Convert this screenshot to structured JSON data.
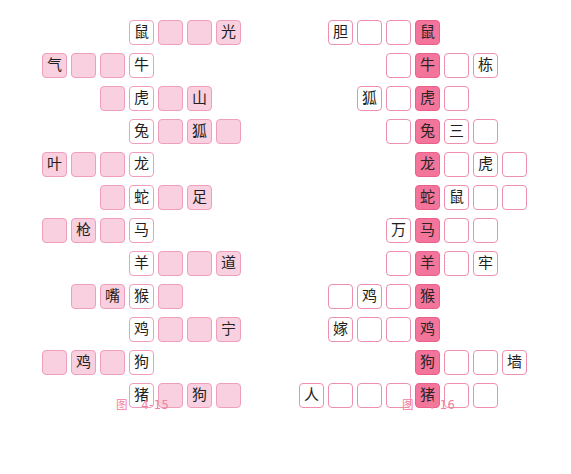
{
  "page": {
    "background": "#ffffff",
    "top_cut_text_left": "",
    "top_cut_text_right": ""
  },
  "colors": {
    "light_pink_fill": "#f9d0e0",
    "light_pink_border": "#ef9ebb",
    "dark_pink_fill": "#f4759b",
    "dark_pink_border": "#ec5f8b",
    "white_cell": "#ffffff",
    "caption_pink": "#f2809f",
    "text_dark": "#231f20"
  },
  "figures": [
    {
      "id": "figure-4-15",
      "caption_word": "图",
      "caption_number": "4-15",
      "cell_size": 25,
      "cell_gap": 4,
      "col_origin_x": 13,
      "row_origin_y": 8,
      "row_pitch": 33,
      "col_pitch": 29,
      "animal_col": 4,
      "style": {
        "blank": "pinkfill",
        "clue": "pinkfill",
        "animal": "whitecell"
      },
      "rows": [
        {
          "row": 0,
          "start_col": 4,
          "cells": [
            {
              "text": "鼠",
              "kind": "animal"
            },
            {
              "text": "",
              "kind": "blank"
            },
            {
              "text": "",
              "kind": "blank"
            },
            {
              "text": "光",
              "kind": "clue"
            }
          ]
        },
        {
          "row": 1,
          "start_col": 1,
          "cells": [
            {
              "text": "气",
              "kind": "clue"
            },
            {
              "text": "",
              "kind": "blank"
            },
            {
              "text": "",
              "kind": "blank"
            },
            {
              "text": "牛",
              "kind": "animal"
            }
          ]
        },
        {
          "row": 2,
          "start_col": 3,
          "cells": [
            {
              "text": "",
              "kind": "blank"
            },
            {
              "text": "虎",
              "kind": "animal"
            },
            {
              "text": "",
              "kind": "blank"
            },
            {
              "text": "山",
              "kind": "clue"
            }
          ]
        },
        {
          "row": 3,
          "start_col": 4,
          "cells": [
            {
              "text": "兔",
              "kind": "animal"
            },
            {
              "text": "",
              "kind": "blank"
            },
            {
              "text": "狐",
              "kind": "clue"
            },
            {
              "text": "",
              "kind": "blank"
            }
          ]
        },
        {
          "row": 4,
          "start_col": 1,
          "cells": [
            {
              "text": "叶",
              "kind": "clue"
            },
            {
              "text": "",
              "kind": "blank"
            },
            {
              "text": "",
              "kind": "blank"
            },
            {
              "text": "龙",
              "kind": "animal"
            }
          ]
        },
        {
          "row": 5,
          "start_col": 3,
          "cells": [
            {
              "text": "",
              "kind": "blank"
            },
            {
              "text": "蛇",
              "kind": "animal"
            },
            {
              "text": "",
              "kind": "blank"
            },
            {
              "text": "足",
              "kind": "clue"
            }
          ]
        },
        {
          "row": 6,
          "start_col": 1,
          "cells": [
            {
              "text": "",
              "kind": "blank"
            },
            {
              "text": "枪",
              "kind": "clue"
            },
            {
              "text": "",
              "kind": "blank"
            },
            {
              "text": "马",
              "kind": "animal"
            }
          ]
        },
        {
          "row": 7,
          "start_col": 4,
          "cells": [
            {
              "text": "羊",
              "kind": "animal"
            },
            {
              "text": "",
              "kind": "blank"
            },
            {
              "text": "",
              "kind": "blank"
            },
            {
              "text": "道",
              "kind": "clue"
            }
          ]
        },
        {
          "row": 8,
          "start_col": 2,
          "cells": [
            {
              "text": "",
              "kind": "blank"
            },
            {
              "text": "嘴",
              "kind": "clue"
            },
            {
              "text": "猴",
              "kind": "animal"
            },
            {
              "text": "",
              "kind": "blank"
            }
          ]
        },
        {
          "row": 9,
          "start_col": 4,
          "cells": [
            {
              "text": "鸡",
              "kind": "animal"
            },
            {
              "text": "",
              "kind": "blank"
            },
            {
              "text": "",
              "kind": "blank"
            },
            {
              "text": "宁",
              "kind": "clue"
            }
          ]
        },
        {
          "row": 10,
          "start_col": 1,
          "cells": [
            {
              "text": "",
              "kind": "blank"
            },
            {
              "text": "鸡",
              "kind": "clue"
            },
            {
              "text": "",
              "kind": "blank"
            },
            {
              "text": "狗",
              "kind": "animal"
            }
          ]
        },
        {
          "row": 11,
          "start_col": 4,
          "cells": [
            {
              "text": "猪",
              "kind": "animal"
            },
            {
              "text": "",
              "kind": "blank"
            },
            {
              "text": "狗",
              "kind": "clue"
            },
            {
              "text": "",
              "kind": "blank"
            }
          ]
        }
      ]
    },
    {
      "id": "figure-4-16",
      "caption_word": "图",
      "caption_number": "4-16",
      "cell_size": 25,
      "cell_gap": 4,
      "col_origin_x": 13,
      "row_origin_y": 8,
      "row_pitch": 33,
      "col_pitch": 29,
      "animal_col": 4,
      "style": {
        "blank": "whitecell2",
        "clue": "whitecell2",
        "animal": "darkfill"
      },
      "rows": [
        {
          "row": 0,
          "start_col": 1,
          "cells": [
            {
              "text": "胆",
              "kind": "clue"
            },
            {
              "text": "",
              "kind": "blank"
            },
            {
              "text": "",
              "kind": "blank"
            },
            {
              "text": "鼠",
              "kind": "animal"
            }
          ]
        },
        {
          "row": 1,
          "start_col": 3,
          "cells": [
            {
              "text": "",
              "kind": "blank"
            },
            {
              "text": "牛",
              "kind": "animal"
            },
            {
              "text": "",
              "kind": "blank"
            },
            {
              "text": "栋",
              "kind": "clue"
            }
          ]
        },
        {
          "row": 2,
          "start_col": 2,
          "cells": [
            {
              "text": "狐",
              "kind": "clue"
            },
            {
              "text": "",
              "kind": "blank"
            },
            {
              "text": "虎",
              "kind": "animal"
            },
            {
              "text": "",
              "kind": "blank"
            }
          ]
        },
        {
          "row": 3,
          "start_col": 3,
          "cells": [
            {
              "text": "",
              "kind": "blank"
            },
            {
              "text": "兔",
              "kind": "animal"
            },
            {
              "text": "三",
              "kind": "clue"
            },
            {
              "text": "",
              "kind": "blank"
            }
          ]
        },
        {
          "row": 4,
          "start_col": 4,
          "cells": [
            {
              "text": "龙",
              "kind": "animal"
            },
            {
              "text": "",
              "kind": "blank"
            },
            {
              "text": "虎",
              "kind": "clue"
            },
            {
              "text": "",
              "kind": "blank"
            }
          ]
        },
        {
          "row": 5,
          "start_col": 4,
          "cells": [
            {
              "text": "蛇",
              "kind": "animal"
            },
            {
              "text": "鼠",
              "kind": "clue"
            },
            {
              "text": "",
              "kind": "blank"
            },
            {
              "text": "",
              "kind": "blank"
            }
          ]
        },
        {
          "row": 6,
          "start_col": 3,
          "cells": [
            {
              "text": "万",
              "kind": "clue"
            },
            {
              "text": "马",
              "kind": "animal"
            },
            {
              "text": "",
              "kind": "blank"
            },
            {
              "text": "",
              "kind": "blank"
            }
          ]
        },
        {
          "row": 7,
          "start_col": 3,
          "cells": [
            {
              "text": "",
              "kind": "blank"
            },
            {
              "text": "羊",
              "kind": "animal"
            },
            {
              "text": "",
              "kind": "blank"
            },
            {
              "text": "牢",
              "kind": "clue"
            }
          ]
        },
        {
          "row": 8,
          "start_col": 1,
          "cells": [
            {
              "text": "",
              "kind": "blank"
            },
            {
              "text": "鸡",
              "kind": "clue"
            },
            {
              "text": "",
              "kind": "blank"
            },
            {
              "text": "猴",
              "kind": "animal"
            }
          ]
        },
        {
          "row": 9,
          "start_col": 1,
          "cells": [
            {
              "text": "嫁",
              "kind": "clue"
            },
            {
              "text": "",
              "kind": "blank"
            },
            {
              "text": "",
              "kind": "blank"
            },
            {
              "text": "鸡",
              "kind": "animal"
            }
          ]
        },
        {
          "row": 10,
          "start_col": 4,
          "cells": [
            {
              "text": "狗",
              "kind": "animal"
            },
            {
              "text": "",
              "kind": "blank"
            },
            {
              "text": "",
              "kind": "blank"
            },
            {
              "text": "墙",
              "kind": "clue"
            }
          ]
        },
        {
          "row": 11,
          "start_col": 0,
          "cells": [
            {
              "text": "人",
              "kind": "clue"
            },
            {
              "text": "",
              "kind": "blank"
            },
            {
              "text": "",
              "kind": "blank"
            },
            {
              "text": "",
              "kind": "blank"
            },
            {
              "text": "猪",
              "kind": "animal"
            },
            {
              "text": "",
              "kind": "blank"
            },
            {
              "text": "",
              "kind": "blank"
            }
          ]
        }
      ]
    }
  ]
}
